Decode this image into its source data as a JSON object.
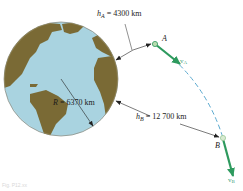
{
  "diagram": {
    "type": "orbital-trajectory",
    "earth": {
      "label_symbol": "R",
      "label_value": "= 6370 km",
      "colors": {
        "ocean": "#a9d3e0",
        "land": "#7a6a35",
        "outline": "#5c5a4a"
      }
    },
    "point_A": {
      "label": "A",
      "altitude_symbol": "h",
      "altitude_subscript": "A",
      "altitude_value": "= 4300 km",
      "velocity_symbol": "v",
      "velocity_subscript": "A"
    },
    "point_B": {
      "label": "B",
      "altitude_symbol": "h",
      "altitude_subscript": "B",
      "altitude_value": "= 12 700 km",
      "velocity_symbol": "v",
      "velocity_subscript": "B"
    },
    "colors": {
      "velocity_arrow": "#2e9a5e",
      "trajectory_dash": "#5aa9cf",
      "dimension_line": "#222222",
      "point_marker": "#b8dcb0"
    },
    "caption": "Fig. P12.xx"
  }
}
